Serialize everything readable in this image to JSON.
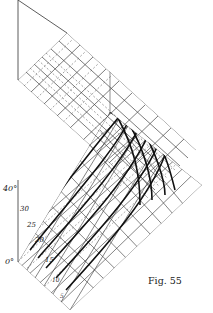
{
  "figure": {
    "caption": "Fig. 55",
    "axis_labels": {
      "top": "40°",
      "l30": "30",
      "l25": "25",
      "l20": "20",
      "l15": "15",
      "l10": "10",
      "l5": "5",
      "bottom": "0°"
    },
    "colors": {
      "ink": "#222222",
      "paper": "#ffffff"
    }
  }
}
